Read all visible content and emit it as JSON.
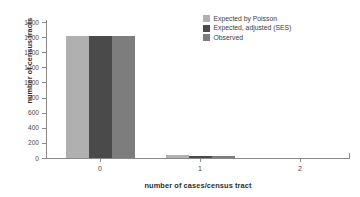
{
  "chart_data": {
    "type": "bar",
    "title": "",
    "xlabel": "number of cases/census tract",
    "ylabel": "number of census tracts",
    "categories": [
      "0",
      "1",
      "2"
    ],
    "series": [
      {
        "name": "Expected by Poisson",
        "color": "#b0b0b0",
        "values": [
          1610,
          34,
          0
        ]
      },
      {
        "name": "Expected, adjusted (SES)",
        "color": "#4a4a4a",
        "values": [
          1612,
          32,
          0
        ]
      },
      {
        "name": "Observed",
        "color": "#7d7d7d",
        "values": [
          1612,
          30,
          0
        ]
      }
    ],
    "ylim": [
      0,
      1800
    ],
    "yticks": [
      "0",
      "200",
      "400",
      "600",
      "800",
      "1000",
      "1200",
      "1400",
      "1600",
      "1800"
    ],
    "ytick_values": [
      0,
      200,
      400,
      600,
      800,
      1000,
      1200,
      1400,
      1600,
      1800
    ],
    "xticks": [
      "0",
      "1",
      "2"
    ],
    "grid": false,
    "legend_position": "top-right",
    "axis_color": "#8a8a8a",
    "background": "#ffffff"
  }
}
